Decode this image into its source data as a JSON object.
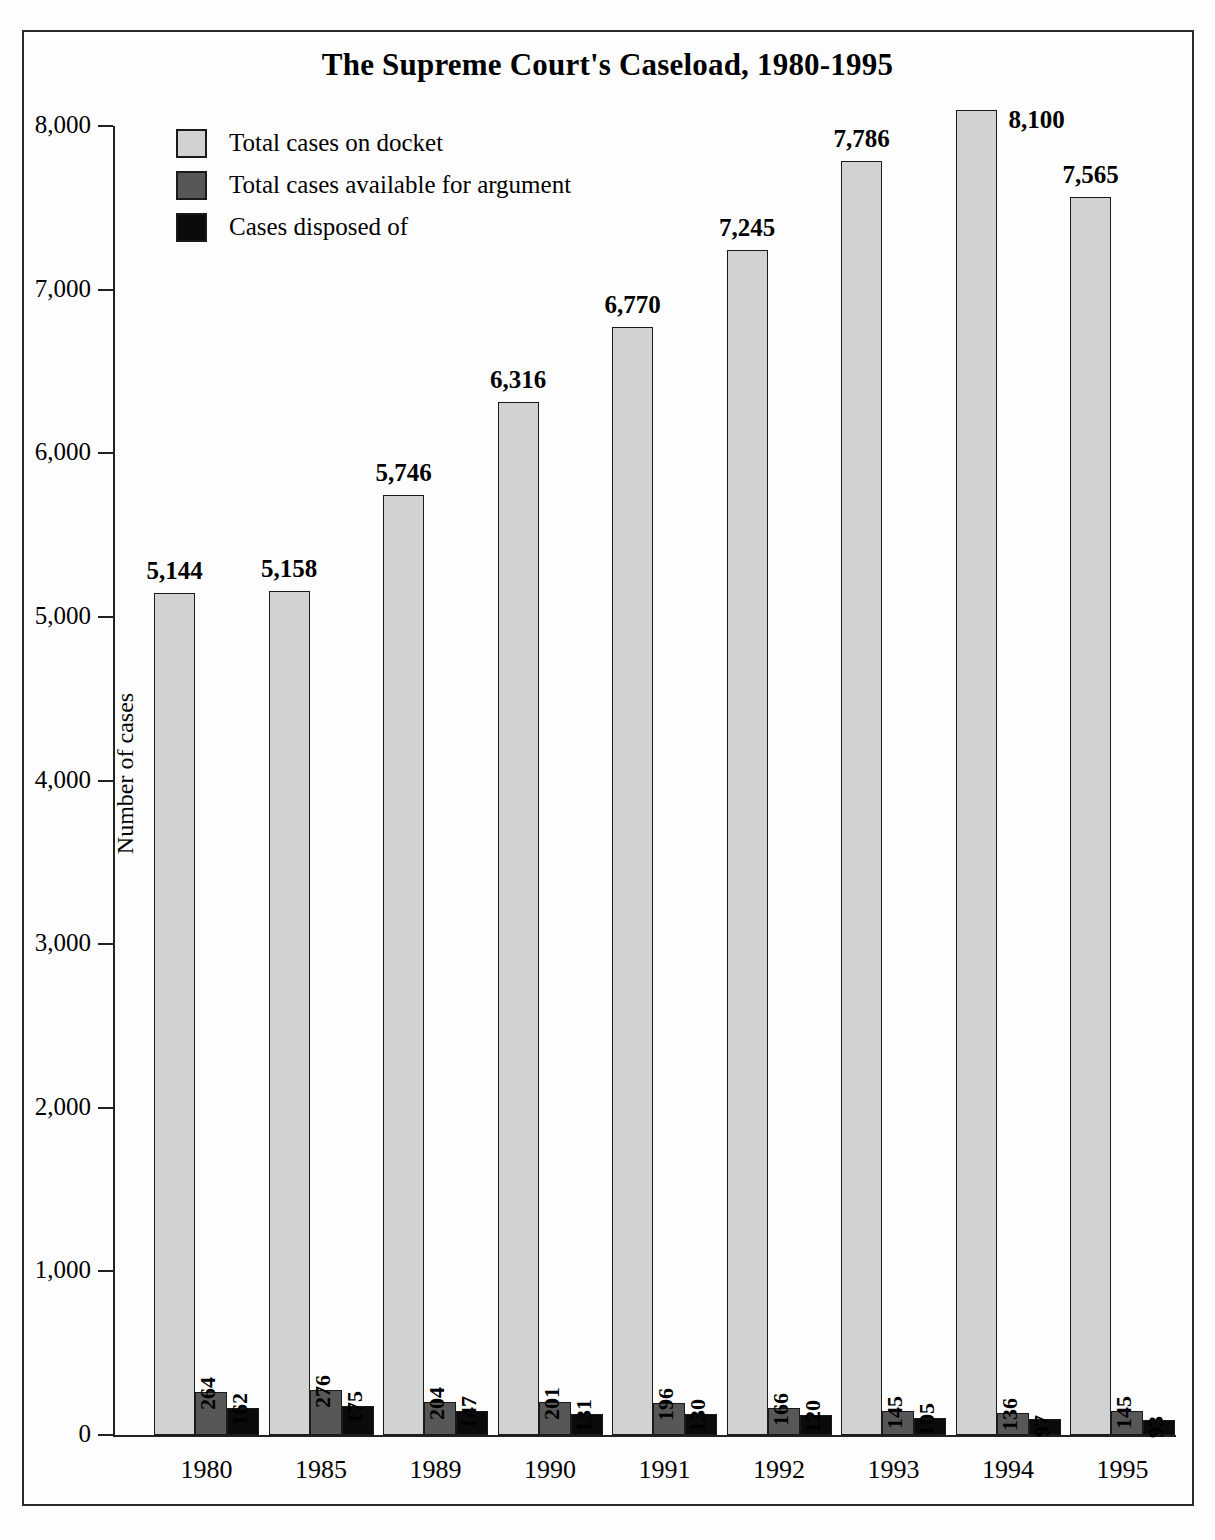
{
  "chart_data": {
    "type": "bar",
    "title": "The Supreme Court's Caseload, 1980-1995",
    "xlabel": "",
    "ylabel": "Number of cases",
    "ylim": [
      0,
      8000
    ],
    "yticks": [
      "0",
      "1,000",
      "2,000",
      "3,000",
      "4,000",
      "5,000",
      "6,000",
      "7,000",
      "8,000"
    ],
    "grid": false,
    "legend_position": "top-left",
    "categories": [
      "1980",
      "1985",
      "1989",
      "1990",
      "1991",
      "1992",
      "1993",
      "1994",
      "1995"
    ],
    "series": [
      {
        "name": "Total cases on docket",
        "color": "#d2d2d2",
        "values": [
          5144,
          5158,
          5746,
          6316,
          6770,
          7245,
          7786,
          8100,
          7565
        ],
        "labels": [
          "5,144",
          "5,158",
          "5,746",
          "6,316",
          "6,770",
          "7,245",
          "7,786",
          "8,100",
          "7,565"
        ]
      },
      {
        "name": "Total cases available for argument",
        "color": "#575757",
        "values": [
          264,
          276,
          204,
          201,
          196,
          166,
          145,
          136,
          145
        ],
        "labels": [
          "264",
          "276",
          "204",
          "201",
          "196",
          "166",
          "145",
          "136",
          "145"
        ]
      },
      {
        "name": "Cases disposed of",
        "color": "#0b0b0b",
        "values": [
          162,
          175,
          147,
          131,
          130,
          120,
          105,
          97,
          93
        ],
        "labels": [
          "162",
          "175",
          "147",
          "131",
          "130",
          "120",
          "105",
          "97",
          "93"
        ]
      }
    ]
  },
  "frame": {
    "border_color": "#2b2b2b"
  }
}
